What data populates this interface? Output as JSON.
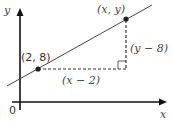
{
  "diagram": {
    "axes": {
      "x_label": "x",
      "y_label": "y",
      "origin_label": "0"
    },
    "points": [
      {
        "label": "(2, 8)"
      },
      {
        "label": "(x, y)"
      }
    ],
    "segments": {
      "horizontal_label": "(x − 2)",
      "vertical_label": "(y − 8)"
    },
    "colors": {
      "axis": "#111111",
      "line": "#444444",
      "dash": "#333333",
      "point": "#222222"
    }
  }
}
